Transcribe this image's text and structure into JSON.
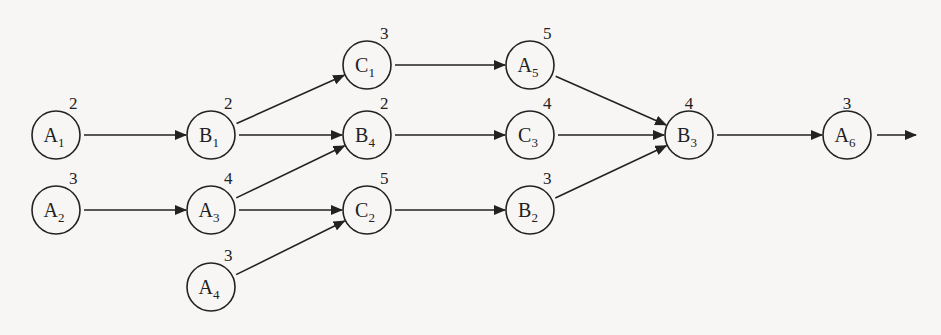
{
  "diagram": {
    "type": "activity-network",
    "node_radius": 24,
    "nodes": [
      {
        "id": "A1",
        "letter": "A",
        "sub": "1",
        "weight": "2",
        "x": 56,
        "y": 135
      },
      {
        "id": "A2",
        "letter": "A",
        "sub": "2",
        "weight": "3",
        "x": 56,
        "y": 210
      },
      {
        "id": "B1",
        "letter": "B",
        "sub": "1",
        "weight": "2",
        "x": 211,
        "y": 135
      },
      {
        "id": "A3",
        "letter": "A",
        "sub": "3",
        "weight": "4",
        "x": 211,
        "y": 210
      },
      {
        "id": "A4",
        "letter": "A",
        "sub": "4",
        "weight": "3",
        "x": 211,
        "y": 287
      },
      {
        "id": "C1",
        "letter": "C",
        "sub": "1",
        "weight": "3",
        "x": 367,
        "y": 65
      },
      {
        "id": "B4",
        "letter": "B",
        "sub": "4",
        "weight": "2",
        "x": 367,
        "y": 135
      },
      {
        "id": "C2",
        "letter": "C",
        "sub": "2",
        "weight": "5",
        "x": 367,
        "y": 210
      },
      {
        "id": "A5",
        "letter": "A",
        "sub": "5",
        "weight": "5",
        "x": 530,
        "y": 65
      },
      {
        "id": "C3",
        "letter": "C",
        "sub": "3",
        "weight": "4",
        "x": 530,
        "y": 135
      },
      {
        "id": "B2",
        "letter": "B",
        "sub": "2",
        "weight": "3",
        "x": 530,
        "y": 210
      },
      {
        "id": "B3",
        "letter": "B",
        "sub": "3",
        "weight": "4",
        "x": 689,
        "y": 135
      },
      {
        "id": "A6",
        "letter": "A",
        "sub": "6",
        "weight": "3",
        "x": 847,
        "y": 135
      }
    ],
    "edges": [
      {
        "from": "A1",
        "to": "B1"
      },
      {
        "from": "A2",
        "to": "A3"
      },
      {
        "from": "B1",
        "to": "C1"
      },
      {
        "from": "B1",
        "to": "B4"
      },
      {
        "from": "A3",
        "to": "B4"
      },
      {
        "from": "A3",
        "to": "C2"
      },
      {
        "from": "A4",
        "to": "C2"
      },
      {
        "from": "C1",
        "to": "A5"
      },
      {
        "from": "B4",
        "to": "C3"
      },
      {
        "from": "C2",
        "to": "B2"
      },
      {
        "from": "A5",
        "to": "B3"
      },
      {
        "from": "C3",
        "to": "B3"
      },
      {
        "from": "B2",
        "to": "B3"
      },
      {
        "from": "B3",
        "to": "A6"
      }
    ],
    "exit_arrow": {
      "from": "A6",
      "to_x": 916,
      "to_y": 135
    },
    "colors": {
      "stroke": "#222222",
      "background": "#f7f6f4"
    }
  }
}
